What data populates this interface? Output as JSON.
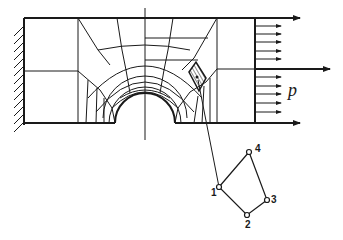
{
  "figure": {
    "stroke_color": "#1a1a1a",
    "background": "#ffffff",
    "load_label": "p",
    "element_nodes": [
      {
        "label": "1",
        "x": 219,
        "y": 187
      },
      {
        "label": "2",
        "x": 247,
        "y": 215
      },
      {
        "label": "3",
        "x": 267,
        "y": 200
      },
      {
        "label": "4",
        "x": 249,
        "y": 152
      }
    ],
    "load_arrows_count": 10,
    "major_arrows_count": 3
  }
}
